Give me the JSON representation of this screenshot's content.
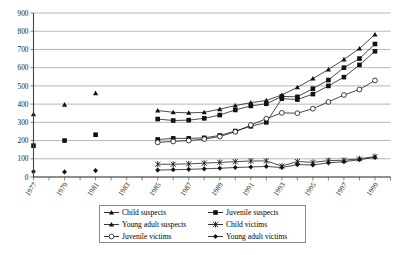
{
  "chart_data": {
    "type": "line",
    "title": "",
    "subtitle": "",
    "xlabel": "",
    "ylabel": "",
    "xlim": [
      1977,
      2000
    ],
    "ylim": [
      0,
      900
    ],
    "ytick_step": 100,
    "yticks": [
      0,
      100,
      200,
      300,
      400,
      500,
      600,
      700,
      800,
      900
    ],
    "xticks": [
      1977,
      1978,
      1979,
      1980,
      1981,
      1982,
      1983,
      1984,
      1985,
      1986,
      1987,
      1988,
      1989,
      1990,
      1991,
      1992,
      1993,
      1994,
      1995,
      1996,
      1997,
      1998,
      1999,
      2000
    ],
    "xtick_labels": [
      "1977",
      "1979",
      "1981",
      "1983",
      "1985",
      "1987",
      "1989",
      "1991",
      "1993",
      "1995",
      "1997",
      "1999"
    ],
    "xtick_label_years": [
      1977,
      1979,
      1981,
      1983,
      1985,
      1987,
      1989,
      1991,
      1993,
      1995,
      1997,
      1999
    ],
    "grid": "horizontal",
    "legend_position": "bottom",
    "series": [
      {
        "name": "Child suspects",
        "marker": "triangle-filled",
        "points": [
          {
            "x": 1977,
            "y": 345
          },
          {
            "x": 1979,
            "y": 397
          },
          {
            "x": 1981,
            "y": 460
          },
          {
            "x": 1985,
            "y": 365
          },
          {
            "x": 1986,
            "y": 355
          },
          {
            "x": 1987,
            "y": 352
          },
          {
            "x": 1988,
            "y": 355
          },
          {
            "x": 1989,
            "y": 372
          },
          {
            "x": 1990,
            "y": 392
          },
          {
            "x": 1991,
            "y": 408
          },
          {
            "x": 1992,
            "y": 420
          },
          {
            "x": 1993,
            "y": 450
          },
          {
            "x": 1994,
            "y": 492
          },
          {
            "x": 1995,
            "y": 540
          },
          {
            "x": 1996,
            "y": 590
          },
          {
            "x": 1997,
            "y": 645
          },
          {
            "x": 1998,
            "y": 705
          },
          {
            "x": 1999,
            "y": 782
          }
        ]
      },
      {
        "name": "Juvenile suspects",
        "marker": "square-filled",
        "points": [
          {
            "x": 1985,
            "y": 318
          },
          {
            "x": 1986,
            "y": 310
          },
          {
            "x": 1987,
            "y": 312
          },
          {
            "x": 1988,
            "y": 322
          },
          {
            "x": 1989,
            "y": 340
          },
          {
            "x": 1990,
            "y": 368
          },
          {
            "x": 1991,
            "y": 390
          },
          {
            "x": 1992,
            "y": 402
          },
          {
            "x": 1993,
            "y": 442
          },
          {
            "x": 1994,
            "y": 440
          },
          {
            "x": 1995,
            "y": 485
          },
          {
            "x": 1996,
            "y": 532
          },
          {
            "x": 1997,
            "y": 600
          },
          {
            "x": 1998,
            "y": 650
          },
          {
            "x": 1999,
            "y": 730
          }
        ]
      },
      {
        "name": "Young adult suspects",
        "marker": "square-filled",
        "points": [
          {
            "x": 1977,
            "y": 172
          },
          {
            "x": 1979,
            "y": 200
          },
          {
            "x": 1981,
            "y": 232
          },
          {
            "x": 1985,
            "y": 206
          },
          {
            "x": 1986,
            "y": 212
          },
          {
            "x": 1987,
            "y": 212
          },
          {
            "x": 1988,
            "y": 215
          },
          {
            "x": 1989,
            "y": 228
          },
          {
            "x": 1990,
            "y": 252
          },
          {
            "x": 1991,
            "y": 278
          },
          {
            "x": 1992,
            "y": 300
          },
          {
            "x": 1993,
            "y": 430
          },
          {
            "x": 1994,
            "y": 425
          },
          {
            "x": 1995,
            "y": 455
          },
          {
            "x": 1996,
            "y": 500
          },
          {
            "x": 1997,
            "y": 548
          },
          {
            "x": 1998,
            "y": 615
          },
          {
            "x": 1999,
            "y": 690
          }
        ]
      },
      {
        "name": "Child victims",
        "marker": "cross-x",
        "points": [
          {
            "x": 1985,
            "y": 70
          },
          {
            "x": 1986,
            "y": 70
          },
          {
            "x": 1987,
            "y": 72
          },
          {
            "x": 1988,
            "y": 76
          },
          {
            "x": 1989,
            "y": 80
          },
          {
            "x": 1990,
            "y": 84
          },
          {
            "x": 1991,
            "y": 88
          },
          {
            "x": 1992,
            "y": 88
          },
          {
            "x": 1993,
            "y": 60
          },
          {
            "x": 1994,
            "y": 85
          },
          {
            "x": 1995,
            "y": 80
          },
          {
            "x": 1996,
            "y": 90
          },
          {
            "x": 1997,
            "y": 92
          },
          {
            "x": 1998,
            "y": 100
          },
          {
            "x": 1999,
            "y": 112
          }
        ]
      },
      {
        "name": "Juvenile victims",
        "marker": "circle-open",
        "points": [
          {
            "x": 1985,
            "y": 190
          },
          {
            "x": 1986,
            "y": 195
          },
          {
            "x": 1987,
            "y": 200
          },
          {
            "x": 1988,
            "y": 208
          },
          {
            "x": 1989,
            "y": 222
          },
          {
            "x": 1990,
            "y": 248
          },
          {
            "x": 1991,
            "y": 285
          },
          {
            "x": 1992,
            "y": 320
          },
          {
            "x": 1993,
            "y": 352
          },
          {
            "x": 1994,
            "y": 350
          },
          {
            "x": 1995,
            "y": 375
          },
          {
            "x": 1996,
            "y": 412
          },
          {
            "x": 1997,
            "y": 450
          },
          {
            "x": 1998,
            "y": 480
          },
          {
            "x": 1999,
            "y": 530
          }
        ]
      },
      {
        "name": "Young adult victims",
        "marker": "diamond-filled",
        "points": [
          {
            "x": 1977,
            "y": 30
          },
          {
            "x": 1979,
            "y": 28
          },
          {
            "x": 1981,
            "y": 35
          },
          {
            "x": 1985,
            "y": 38
          },
          {
            "x": 1986,
            "y": 40
          },
          {
            "x": 1987,
            "y": 42
          },
          {
            "x": 1988,
            "y": 45
          },
          {
            "x": 1989,
            "y": 48
          },
          {
            "x": 1990,
            "y": 52
          },
          {
            "x": 1991,
            "y": 55
          },
          {
            "x": 1992,
            "y": 58
          },
          {
            "x": 1993,
            "y": 52
          },
          {
            "x": 1994,
            "y": 68
          },
          {
            "x": 1995,
            "y": 66
          },
          {
            "x": 1996,
            "y": 78
          },
          {
            "x": 1997,
            "y": 84
          },
          {
            "x": 1998,
            "y": 95
          },
          {
            "x": 1999,
            "y": 108
          }
        ]
      }
    ]
  },
  "legend": {
    "entries": [
      {
        "label": "Child suspects",
        "marker": "triangle-filled"
      },
      {
        "label": "Juvenile suspects",
        "marker": "square-filled"
      },
      {
        "label": "Young adult suspects",
        "marker": "triangle-filled"
      },
      {
        "label": "Child victims",
        "marker": "cross-x"
      },
      {
        "label": "Juvenile victims",
        "marker": "circle-open"
      },
      {
        "label": "Young adult victims",
        "marker": "diamond-filled"
      }
    ]
  },
  "colors": {
    "ink": "#111111",
    "grid": "#9a9a9a",
    "axis": "#444444",
    "background": "#ffffff"
  }
}
